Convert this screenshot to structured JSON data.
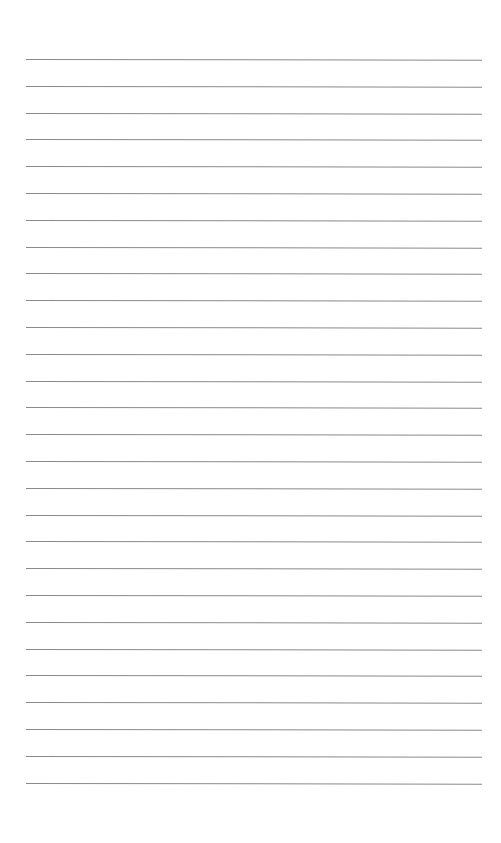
{
  "page": {
    "type": "lined-paper",
    "background_color": "#ffffff",
    "rule_color": "#8a8a8a",
    "rule_count": 28,
    "first_rule_y": 59,
    "rule_spacing": 26.8,
    "rule_left": 26,
    "rule_width": 456
  }
}
